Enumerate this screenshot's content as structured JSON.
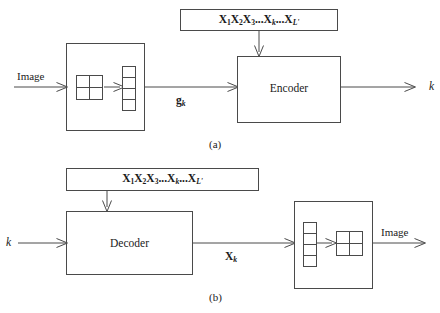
{
  "figure": {
    "panels": [
      {
        "id": "a",
        "caption": "(a)",
        "sequence_box_label": "X1X2X3...Xk...XL'",
        "sequence_parts": {
          "x1": "X",
          "s1": "1",
          "x2": "X",
          "s2": "2",
          "x3": "X",
          "s3": "3",
          "ellipsis1": "...",
          "xk": "X",
          "sk": "k",
          "ellipsis2": "...",
          "xl": "X",
          "sl": "L'"
        },
        "input_label": "Image",
        "process_label": "Encoder",
        "intermediate_label": "g",
        "intermediate_subscript": "k",
        "output_label": "k"
      },
      {
        "id": "b",
        "caption": "(b)",
        "sequence_box_label": "X1X2X3...Xk...XL'",
        "sequence_parts": {
          "x1": "X",
          "s1": "1",
          "x2": "X",
          "s2": "2",
          "x3": "X",
          "s3": "3",
          "ellipsis1": "...",
          "xk": "X",
          "sk": "k",
          "ellipsis2": "...",
          "xl": "X",
          "sl": "L'"
        },
        "input_label": "k",
        "process_label": "Decoder",
        "intermediate_label": "X",
        "intermediate_subscript": "k",
        "output_label": "Image"
      }
    ]
  },
  "colors": {
    "stroke": "#4a4a4a",
    "background": "#ffffff",
    "text": "#1a1a1a"
  }
}
